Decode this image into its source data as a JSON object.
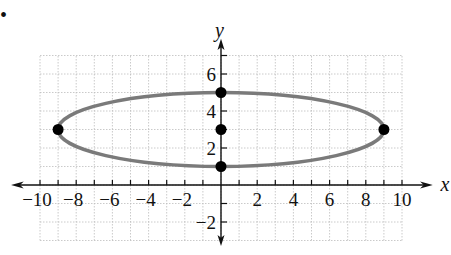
{
  "problem": {
    "bullet": "•"
  },
  "chart_data": {
    "type": "line",
    "title": "",
    "xlabel": "x",
    "ylabel": "y",
    "xlim": [
      -11,
      11
    ],
    "ylim": [
      -3,
      7
    ],
    "grid": true,
    "x_ticks": [
      -10,
      -8,
      -6,
      -4,
      -2,
      2,
      4,
      6,
      8,
      10
    ],
    "x_tick_labels": [
      "−10",
      "−8",
      "−6",
      "−4",
      "−2",
      "2",
      "4",
      "6",
      "8",
      "10"
    ],
    "y_ticks": [
      -2,
      2,
      4,
      6
    ],
    "y_tick_labels": [
      "−2",
      "2",
      "4",
      "6"
    ],
    "series": [
      {
        "name": "ellipse",
        "shape": "ellipse",
        "center": [
          0,
          3
        ],
        "semi_major_x": 9,
        "semi_minor_y": 2,
        "equation": "x^2/81 + (y-3)^2/4 = 1",
        "color": "#7a7a7a"
      }
    ],
    "points": [
      {
        "x": -9,
        "y": 3,
        "label": "left vertex"
      },
      {
        "x": 9,
        "y": 3,
        "label": "right vertex"
      },
      {
        "x": 0,
        "y": 5,
        "label": "top co-vertex"
      },
      {
        "x": 0,
        "y": 1,
        "label": "bottom co-vertex"
      },
      {
        "x": 0,
        "y": 3,
        "label": "center"
      }
    ],
    "colors": {
      "axis": "#111111",
      "grid": "#bdbdbd",
      "curve": "#7a7a7a",
      "point": "#000000"
    }
  }
}
